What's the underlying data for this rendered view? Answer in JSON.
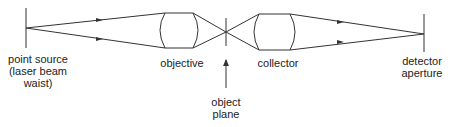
{
  "diagram": {
    "labels": {
      "point_source": "point source\n(laser beam\nwaist)",
      "objective": "objective",
      "object_plane": "object\nplane",
      "collector": "collector",
      "detector_aperture": "detector\naperture"
    },
    "colors": {
      "line": "#333333",
      "text": "#222222"
    }
  }
}
